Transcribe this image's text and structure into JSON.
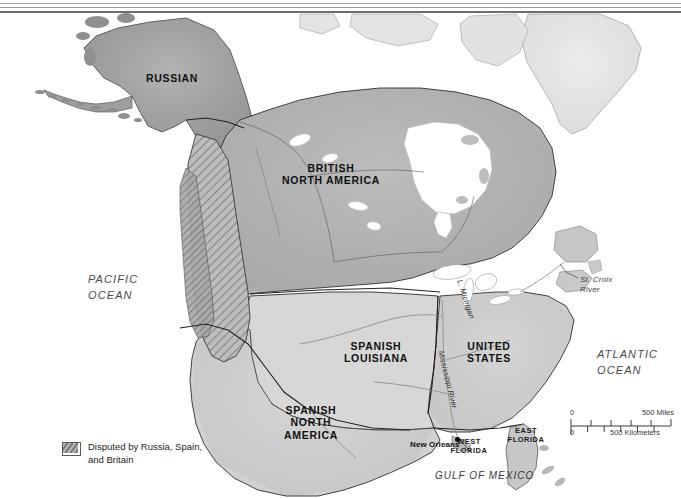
{
  "map": {
    "title_semantic": "north-america-1800-territorial-map",
    "territories": [
      {
        "id": "russian",
        "label": "RUSSIAN",
        "x": 168,
        "y": 72,
        "fill": "#9a9a9a"
      },
      {
        "id": "british-na",
        "label": "BRITISH\nNORTH AMERICA",
        "x": 330,
        "y": 168,
        "fill": "#b2b2b2"
      },
      {
        "id": "spanish-louisiana",
        "label": "SPANISH\nLOUISIANA",
        "x": 375,
        "y": 346,
        "fill": "#d6d6d6"
      },
      {
        "id": "united-states",
        "label": "UNITED\nSTATES",
        "x": 487,
        "y": 346,
        "fill": "#cfcfcf"
      },
      {
        "id": "spanish-na",
        "label": "SPANISH\nNORTH\nAMERICA",
        "x": 308,
        "y": 410,
        "fill": "#d0d0d0"
      }
    ],
    "sub_regions": [
      {
        "id": "west-florida",
        "label": "WEST\nFLORIDA",
        "x": 467,
        "y": 440
      },
      {
        "id": "east-florida",
        "label": "EAST\nFLORIDA",
        "x": 523,
        "y": 429
      }
    ],
    "oceans": [
      {
        "id": "pacific-ocean",
        "label": "PACIFIC\nOCEAN",
        "x": 88,
        "y": 272
      },
      {
        "id": "atlantic-ocean",
        "label": "ATLANTIC\nOCEAN",
        "x": 597,
        "y": 347
      }
    ],
    "seas": [
      {
        "id": "gulf-of-mexico",
        "label": "GULF OF MEXICO",
        "x": 435,
        "y": 471
      }
    ],
    "water_features": [
      {
        "id": "st-croix-river",
        "label": "St. Croix\nRiver",
        "x": 580,
        "y": 277
      }
    ],
    "rivers": [
      {
        "id": "mississippi-river",
        "label": "Mississippi River",
        "x": 444,
        "y": 352,
        "rotation": 76
      },
      {
        "id": "lake-michigan",
        "label": "L. Michigan",
        "x": 466,
        "y": 281,
        "rotation": 72
      }
    ],
    "cities": [
      {
        "id": "new-orleans",
        "label": "New Orleans",
        "x": 416,
        "y": 441,
        "dot_x": 456,
        "dot_y": 440
      }
    ]
  },
  "legend": {
    "swatch_name": "disputed-territory-swatch",
    "swatch_fill": "#8f8f8f",
    "text": "Disputed by Russia, Spain,\nand Britain",
    "x": 62,
    "y": 441
  },
  "scale_bar": {
    "x": 570,
    "y": 408,
    "miles": {
      "zero": "0",
      "max": "500 Miles"
    },
    "kilometers": {
      "zero": "0",
      "max": "500 Kilometers"
    },
    "tick_count_miles": 5,
    "tick_count_km": 6
  },
  "colors": {
    "land_light": "#dcdcdc",
    "land_mid": "#c4c4c4",
    "land_dark": "#9c9c9c",
    "british_fill": "#b0b0b0",
    "russian_fill": "#9a9a9a",
    "greenland_fill": "#ebebeb",
    "border_line": "#2b2b2b",
    "water": "#ffffff",
    "text": "#1b1b1b",
    "rule": "#6e6e6e"
  }
}
